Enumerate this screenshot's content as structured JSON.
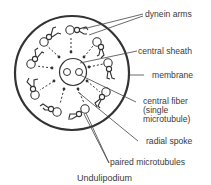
{
  "diagram": {
    "caption": "Undulipodium",
    "labels": {
      "dynein_arms": "dynein arms",
      "central_sheath": "central sheath",
      "membrane": "membrane",
      "central_fiber_1": "central fiber",
      "central_fiber_2": "(single",
      "central_fiber_3": "microtubule)",
      "radial_spoke": "radial spoke",
      "paired_microtubules": "paired microtubules"
    },
    "colors": {
      "stroke": "#333333",
      "text": "#3a3a3a",
      "background": "#ffffff"
    }
  }
}
